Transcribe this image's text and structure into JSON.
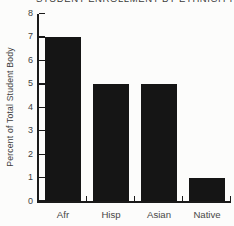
{
  "chart_data": {
    "type": "bar",
    "title_clipped_at_top": "STUDENT ENROLLMENT BY ETHNICITY",
    "categories": [
      "Afr",
      "Hisp",
      "Asian",
      "Native"
    ],
    "values": [
      7,
      5,
      5,
      1
    ],
    "xlabel": "",
    "ylabel": "Percent of Total Student Body",
    "ylim": [
      0,
      8
    ],
    "yticks": [
      8,
      7,
      6,
      5,
      4,
      3,
      2,
      1,
      0
    ],
    "grid": false,
    "legend": "none"
  },
  "colors": {
    "bar": "#151515",
    "axis": "#1a1a1a",
    "tick_text": "#3f3f3f",
    "category_text": "#474747",
    "background": "#fcfcfb"
  }
}
